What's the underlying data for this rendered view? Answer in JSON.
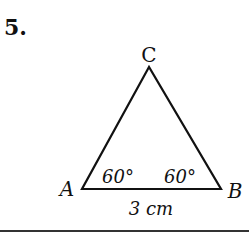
{
  "problem": {
    "number": "5."
  },
  "diagram": {
    "type": "triangle",
    "vertices": {
      "A": "A",
      "B": "B",
      "C": "C"
    },
    "angles": {
      "A": "60°",
      "B": "60°"
    },
    "side_AB": "3 cm",
    "colors": {
      "stroke": "#111111",
      "background": "#ffffff"
    }
  }
}
